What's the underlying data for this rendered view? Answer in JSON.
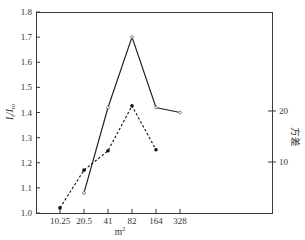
{
  "chart_data": {
    "type": "line",
    "title": "",
    "xlabel": "m²",
    "ylabel": "I_t/I_to",
    "y2label": "方差",
    "categories": [
      "10.25",
      "20.5",
      "41",
      "82",
      "164",
      "328"
    ],
    "ylim": [
      1.0,
      1.8
    ],
    "y_ticks": [
      "1.0",
      "1.1",
      "1.2",
      "1.3",
      "1.4",
      "1.5",
      "1.6",
      "1.7",
      "1.8"
    ],
    "y2lim": [
      0,
      39.4
    ],
    "y2_ticks": [
      "10",
      "20"
    ],
    "grid": false,
    "legend": null,
    "series": [
      {
        "name": "I_t/I_to",
        "axis": "left",
        "style": "solid",
        "marker": "open",
        "values": [
          null,
          1.08,
          1.42,
          1.7,
          1.42,
          1.4
        ]
      },
      {
        "name": "方差",
        "axis": "right",
        "style": "dashed",
        "marker": "filled",
        "values": [
          1,
          8.4,
          12.2,
          21.0,
          12.4,
          null
        ]
      }
    ]
  }
}
